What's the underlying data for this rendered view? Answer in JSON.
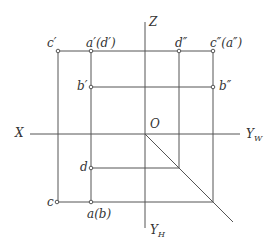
{
  "diagram": {
    "title": "",
    "line_color": "#555555",
    "axes": {
      "x_label": "X",
      "z_label": "Z",
      "yw_label": "Y",
      "yw_sub": "W",
      "yh_label": "Y",
      "yh_sub": "H",
      "origin_label": "O"
    },
    "points": {
      "c_prime": "c′",
      "a_prime_d_prime": "a′(d′)",
      "b_prime": "b′",
      "d_double_prime": "d″",
      "c_double_prime_a_double_prime": "c″(a″)",
      "b_double_prime": "b″",
      "d": "d",
      "c": "c",
      "a_b": "a(b)"
    }
  }
}
